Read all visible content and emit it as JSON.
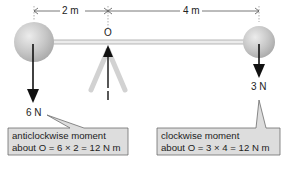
{
  "diagram": {
    "type": "lever-moments",
    "dimensions": {
      "left_distance": "2 m",
      "right_distance": "4 m"
    },
    "pivot": {
      "label": "O"
    },
    "forces": {
      "left": {
        "label": "6 N",
        "direction": "down"
      },
      "right": {
        "label": "3 N",
        "direction": "down"
      }
    },
    "callouts": {
      "left": {
        "line1": "anticlockwise moment",
        "line2": "about O = 6 × 2 = 12 N m"
      },
      "right": {
        "line1": "clockwise moment",
        "line2": "about O = 3 × 4 = 12 N m"
      }
    },
    "colors": {
      "sphere": "#c8c8c8",
      "beam": "#dcdcdc",
      "pivot_support": "#cfcfcf",
      "callout_fill": "#dddddd",
      "arrow": "#111111"
    }
  }
}
